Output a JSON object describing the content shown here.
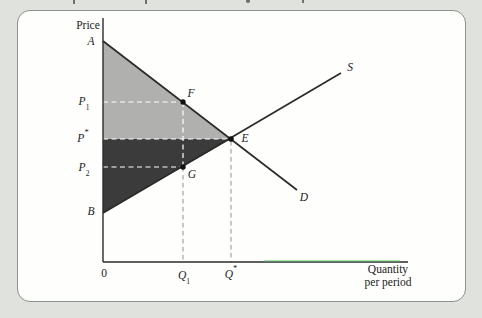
{
  "page": {
    "background_color": "#e0e3dd",
    "panel_background": "#fefefd",
    "panel_border_color": "#8c918c"
  },
  "figure": {
    "type": "supply-demand-surplus-diagram",
    "y_axis_title": "Price",
    "x_axis_title_line1": "Quantity",
    "x_axis_title_line2": "per period",
    "origin_label": "0",
    "labels": {
      "a": "A",
      "b": "B",
      "p1": {
        "base": "P",
        "sub": "1"
      },
      "pstar": {
        "base": "P",
        "sup": "*"
      },
      "p2": {
        "base": "P",
        "sub": "2"
      },
      "q1": {
        "base": "Q",
        "sub": "1"
      },
      "qstar": {
        "base": "Q",
        "sup": "*"
      },
      "f": "F",
      "e": "E",
      "g": "G",
      "s": "S",
      "d": "D"
    },
    "colors": {
      "consumer_surplus_fill": "#b0b0af",
      "producer_surplus_fill": "#3b3b3b",
      "curve_stroke": "#2b2b2b",
      "axis_stroke": "#2b2b2b",
      "dashed_inside_region": "#ffffff",
      "dashed_outside_region": "#9b9b9b",
      "point_dot": "#111111",
      "axis_green_artifact": "#8fe48f"
    }
  }
}
